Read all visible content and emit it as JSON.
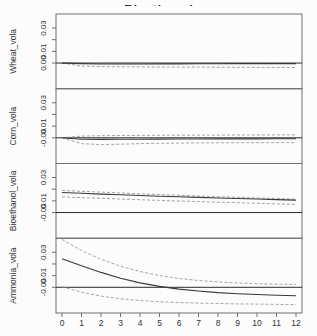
{
  "chart_data": {
    "type": "line",
    "title": "Bioethanol",
    "subtitle": "",
    "xlabel": "",
    "ylabel": "",
    "x": [
      0,
      1,
      2,
      3,
      4,
      5,
      6,
      7,
      8,
      9,
      10,
      11,
      12
    ],
    "x_tick_labels": [
      "0",
      "1",
      "2",
      "3",
      "4",
      "5",
      "6",
      "7",
      "8",
      "9",
      "10",
      "11",
      "12"
    ],
    "zero_line": true,
    "grid": false,
    "legend": null,
    "panels": [
      {
        "label": "Wheat_vola",
        "ylim": [
          -0.022,
          0.042
        ],
        "yticks": [
          {
            "v": 0.0,
            "label": "0.00"
          },
          {
            "v": 0.01,
            "label": "0.01"
          },
          {
            "v": 0.02,
            "label": ""
          },
          {
            "v": 0.03,
            "label": "0.03"
          }
        ],
        "series": [
          {
            "name": "response",
            "style": "solid",
            "values": [
              0.0,
              -0.0005,
              -0.0008,
              -0.0008,
              -0.0008,
              -0.0007,
              -0.0007,
              -0.0006,
              -0.0006,
              -0.0005,
              -0.0005,
              -0.0005,
              -0.0005
            ]
          },
          {
            "name": "ci_upper",
            "style": "dashed",
            "values": [
              0.0,
              0.0004,
              0.0005,
              0.0005,
              0.0005,
              0.0005,
              0.0005,
              0.0005,
              0.0005,
              0.0005,
              0.0005,
              0.0005,
              0.0005
            ]
          },
          {
            "name": "ci_lower",
            "style": "dashed",
            "values": [
              0.0,
              -0.0025,
              -0.003,
              -0.0032,
              -0.0033,
              -0.0034,
              -0.0035,
              -0.0035,
              -0.0036,
              -0.0036,
              -0.0037,
              -0.0037,
              -0.0038
            ]
          }
        ]
      },
      {
        "label": "Corn_vola",
        "ylim": [
          -0.022,
          0.042
        ],
        "yticks": [
          {
            "v": 0.0,
            "label": "-0.00"
          },
          {
            "v": 0.01,
            "label": "0.01"
          },
          {
            "v": 0.02,
            "label": ""
          },
          {
            "v": 0.03,
            "label": "0.03"
          }
        ],
        "series": [
          {
            "name": "response",
            "style": "solid",
            "values": [
              0.0,
              -0.0012,
              -0.0014,
              -0.0013,
              -0.0012,
              -0.0011,
              -0.001,
              -0.001,
              -0.0009,
              -0.0009,
              -0.0009,
              -0.0008,
              -0.0008
            ]
          },
          {
            "name": "ci_upper",
            "style": "dashed",
            "values": [
              0.0,
              0.0015,
              0.0018,
              0.002,
              0.0021,
              0.0022,
              0.0022,
              0.0023,
              0.0023,
              0.0024,
              0.0024,
              0.0025,
              0.0025
            ]
          },
          {
            "name": "ci_lower",
            "style": "dashed",
            "values": [
              0.0,
              -0.005,
              -0.0058,
              -0.0055,
              -0.005,
              -0.0047,
              -0.0045,
              -0.0044,
              -0.0043,
              -0.0042,
              -0.0042,
              -0.0041,
              -0.0041
            ]
          }
        ]
      },
      {
        "label": "Bioethanol_vola",
        "ylim": [
          -0.022,
          0.042
        ],
        "yticks": [
          {
            "v": 0.0,
            "label": "-0.00"
          },
          {
            "v": 0.01,
            "label": "0.01"
          },
          {
            "v": 0.02,
            "label": ""
          },
          {
            "v": 0.03,
            "label": "0.03"
          }
        ],
        "series": [
          {
            "name": "response",
            "style": "solid",
            "values": [
              0.0172,
              0.0165,
              0.0158,
              0.0152,
              0.0146,
              0.014,
              0.0135,
              0.013,
              0.0125,
              0.012,
              0.0116,
              0.0111,
              0.0107
            ]
          },
          {
            "name": "ci_upper",
            "style": "dashed",
            "values": [
              0.019,
              0.0182,
              0.0175,
              0.0168,
              0.0161,
              0.0155,
              0.0148,
              0.0142,
              0.0136,
              0.0131,
              0.0125,
              0.012,
              0.0115
            ]
          },
          {
            "name": "ci_lower",
            "style": "dashed",
            "values": [
              0.0135,
              0.0128,
              0.0122,
              0.0116,
              0.011,
              0.0104,
              0.0099,
              0.0094,
              0.0089,
              0.0084,
              0.0079,
              0.0074,
              0.007
            ]
          }
        ]
      },
      {
        "label": "Ammonia_vola",
        "ylim": [
          -0.022,
          0.042
        ],
        "yticks": [
          {
            "v": 0.0,
            "label": "-0.00"
          },
          {
            "v": 0.01,
            "label": "0.01"
          },
          {
            "v": 0.02,
            "label": ""
          },
          {
            "v": 0.03,
            "label": "0.03"
          }
        ],
        "series": [
          {
            "name": "response",
            "style": "solid",
            "values": [
              0.0245,
              0.0185,
              0.0128,
              0.0078,
              0.0038,
              0.0008,
              -0.0015,
              -0.0032,
              -0.0045,
              -0.0055,
              -0.0062,
              -0.0068,
              -0.0072
            ]
          },
          {
            "name": "ci_upper",
            "style": "dashed",
            "values": [
              0.041,
              0.0315,
              0.024,
              0.018,
              0.0135,
              0.01,
              0.0075,
              0.0058,
              0.0046,
              0.0037,
              0.0031,
              0.0027,
              0.0025
            ]
          },
          {
            "name": "ci_lower",
            "style": "dashed",
            "values": [
              0.0005,
              -0.0042,
              -0.0075,
              -0.0098,
              -0.0113,
              -0.0123,
              -0.013,
              -0.0135,
              -0.0139,
              -0.0142,
              -0.0144,
              -0.0146,
              -0.0148
            ]
          }
        ]
      }
    ],
    "colors": {
      "response": "#3a3a3a",
      "ci": "#9a9a9a",
      "zero_line": "#2b2b2b",
      "box": "#6e6e6e",
      "tick_text": "#333333",
      "panel_label_text": "#333333",
      "background": "#fcfcfc"
    }
  }
}
